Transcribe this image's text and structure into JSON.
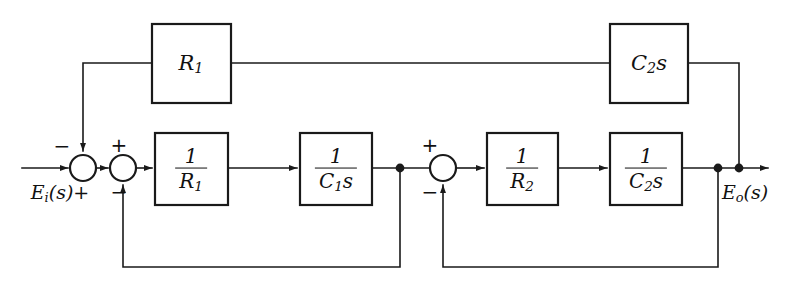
{
  "diagram": {
    "type": "control-block-diagram",
    "colors": {
      "line": "#1a1a1a",
      "background": "#ffffff",
      "text": "#111111"
    },
    "signals": {
      "input_label": "E",
      "input_sub": "i",
      "input_arg": "(s)",
      "input_sign": "+",
      "output_label": "E",
      "output_sub": "o",
      "output_arg": "(s)"
    },
    "blocks": [
      {
        "id": "feedback-r1",
        "name": "R1",
        "kind": "plain",
        "text": "R",
        "sub": "1",
        "x": 152,
        "y": 24,
        "w": 79,
        "h": 79
      },
      {
        "id": "feedback-c2s",
        "name": "C2s",
        "kind": "plain",
        "text": "C",
        "sub": "2",
        "tail": "s",
        "x": 610,
        "y": 24,
        "w": 78,
        "h": 79
      },
      {
        "id": "forward-inv-r1",
        "name": "1/R1",
        "kind": "fraction",
        "numerator": "1",
        "denominator": "R",
        "den_sub": "1",
        "x": 155,
        "y": 133,
        "w": 73,
        "h": 72
      },
      {
        "id": "forward-inv-c1s",
        "name": "1/C1s",
        "kind": "fraction",
        "numerator": "1",
        "denominator": "C",
        "den_sub": "1",
        "den_tail": "s",
        "x": 300,
        "y": 133,
        "w": 72,
        "h": 72
      },
      {
        "id": "forward-inv-r2",
        "name": "1/R2",
        "kind": "fraction",
        "numerator": "1",
        "denominator": "R",
        "den_sub": "2",
        "x": 487,
        "y": 133,
        "w": 71,
        "h": 72
      },
      {
        "id": "forward-inv-c2s",
        "name": "1/C2s",
        "kind": "fraction",
        "numerator": "1",
        "denominator": "C",
        "den_sub": "2",
        "den_tail": "s",
        "x": 610,
        "y": 133,
        "w": 72,
        "h": 72
      }
    ],
    "summing_junctions": [
      {
        "id": "sum-1",
        "name": "summing-junction-1",
        "cx": 83,
        "cy": 168,
        "r": 13,
        "signs": [
          {
            "text": "−",
            "x": 62,
            "y": 146
          }
        ]
      },
      {
        "id": "sum-2",
        "name": "summing-junction-2",
        "cx": 123,
        "cy": 168,
        "r": 13,
        "signs": [
          {
            "text": "+",
            "x": 119,
            "y": 145
          },
          {
            "text": "−",
            "x": 119,
            "y": 192
          }
        ]
      },
      {
        "id": "sum-3",
        "name": "summing-junction-3",
        "cx": 443,
        "cy": 168,
        "r": 13,
        "signs": [
          {
            "text": "+",
            "x": 430,
            "y": 145
          },
          {
            "text": "−",
            "x": 430,
            "y": 192
          }
        ]
      }
    ],
    "junction_dots": [
      {
        "id": "node-c1s-out",
        "name": "node-after-1-over-c1s",
        "cx": 400,
        "cy": 168,
        "r": 4.2
      },
      {
        "id": "node-out-1",
        "name": "node-output-feedback",
        "cx": 718,
        "cy": 168,
        "r": 4.2
      },
      {
        "id": "node-out-2",
        "name": "node-output-c2s-return",
        "cx": 739,
        "cy": 168,
        "r": 4.2
      }
    ],
    "annotations": {
      "input_text": "E",
      "output_text": "E"
    }
  }
}
